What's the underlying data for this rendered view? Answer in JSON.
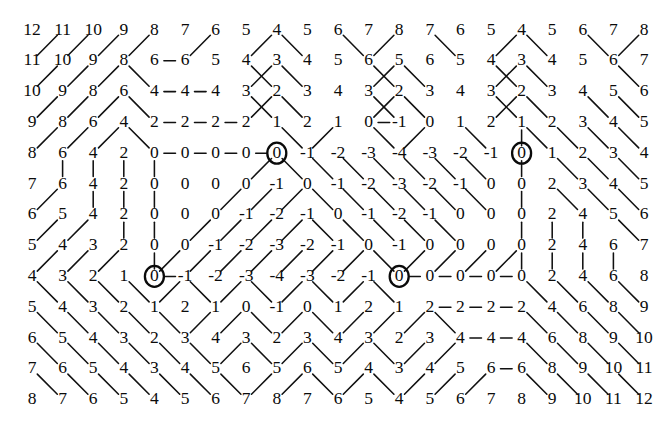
{
  "figure": {
    "rows": 13,
    "cols": 21,
    "origin_x": 32,
    "origin_y": 30,
    "step_x": 30.6,
    "step_y": 30.8,
    "ink_color": "#0b0b0b",
    "background_color": "#ffffff",
    "line_color": "#111111",
    "marker_label": "circled-minimum"
  },
  "chart_data": {
    "type": "heatmap",
    "xlabel": "",
    "ylabel": "",
    "categories": [
      "c1",
      "c2",
      "c3",
      "c4",
      "c5",
      "c6",
      "c7",
      "c8",
      "c9",
      "c10",
      "c11",
      "c12",
      "c13",
      "c14",
      "c15",
      "c16",
      "c17",
      "c18",
      "c19",
      "c20",
      "c21"
    ],
    "grid": [
      [
        12,
        11,
        10,
        9,
        8,
        7,
        6,
        5,
        4,
        5,
        6,
        7,
        8,
        7,
        6,
        5,
        4,
        5,
        6,
        7,
        8
      ],
      [
        11,
        10,
        9,
        8,
        6,
        6,
        5,
        4,
        3,
        4,
        5,
        6,
        5,
        6,
        5,
        4,
        3,
        4,
        5,
        6,
        7
      ],
      [
        10,
        9,
        8,
        6,
        4,
        4,
        4,
        3,
        2,
        3,
        4,
        3,
        2,
        3,
        4,
        3,
        2,
        3,
        4,
        5,
        6
      ],
      [
        9,
        8,
        6,
        4,
        2,
        2,
        2,
        2,
        1,
        2,
        1,
        0,
        -1,
        0,
        1,
        2,
        1,
        2,
        3,
        4,
        5
      ],
      [
        8,
        6,
        4,
        2,
        0,
        0,
        0,
        0,
        0,
        -1,
        -2,
        -3,
        -4,
        -3,
        -2,
        -1,
        0,
        1,
        2,
        3,
        4
      ],
      [
        7,
        6,
        4,
        2,
        0,
        0,
        0,
        0,
        -1,
        0,
        -1,
        -2,
        -3,
        -2,
        -1,
        0,
        0,
        2,
        3,
        4,
        5
      ],
      [
        6,
        5,
        4,
        2,
        0,
        0,
        0,
        -1,
        -2,
        -1,
        0,
        -1,
        -2,
        -1,
        0,
        0,
        0,
        2,
        4,
        5,
        6
      ],
      [
        5,
        4,
        3,
        2,
        0,
        0,
        -1,
        -2,
        -3,
        -2,
        -1,
        0,
        -1,
        0,
        0,
        0,
        0,
        2,
        4,
        6,
        7
      ],
      [
        4,
        3,
        2,
        1,
        0,
        -1,
        -2,
        -3,
        -4,
        -3,
        -2,
        -1,
        0,
        0,
        0,
        0,
        0,
        2,
        4,
        6,
        8
      ],
      [
        5,
        4,
        3,
        2,
        1,
        2,
        1,
        0,
        -1,
        0,
        1,
        2,
        1,
        2,
        2,
        2,
        2,
        4,
        6,
        8,
        9
      ],
      [
        6,
        5,
        4,
        3,
        2,
        3,
        4,
        3,
        2,
        3,
        4,
        3,
        2,
        3,
        4,
        4,
        4,
        6,
        8,
        9,
        10
      ],
      [
        7,
        6,
        5,
        4,
        3,
        4,
        5,
        6,
        5,
        6,
        5,
        4,
        3,
        4,
        5,
        6,
        6,
        8,
        9,
        10,
        11
      ],
      [
        8,
        7,
        6,
        5,
        4,
        5,
        6,
        7,
        8,
        7,
        6,
        5,
        4,
        5,
        6,
        7,
        8,
        9,
        10,
        11,
        12
      ]
    ],
    "circled_cells": [
      {
        "row": 4,
        "col": 8,
        "value": 0
      },
      {
        "row": 4,
        "col": 16,
        "value": 0
      },
      {
        "row": 8,
        "col": 4,
        "value": 0
      },
      {
        "row": 8,
        "col": 12,
        "value": 0
      }
    ],
    "edges": [
      [
        0,
        1,
        1,
        0
      ],
      [
        0,
        2,
        1,
        1
      ],
      [
        0,
        3,
        1,
        2
      ],
      [
        0,
        4,
        1,
        3
      ],
      [
        0,
        6,
        1,
        5
      ],
      [
        0,
        8,
        1,
        7
      ],
      [
        0,
        8,
        1,
        9
      ],
      [
        0,
        10,
        1,
        11
      ],
      [
        0,
        12,
        1,
        11
      ],
      [
        0,
        13,
        1,
        14
      ],
      [
        0,
        16,
        1,
        15
      ],
      [
        0,
        16,
        1,
        17
      ],
      [
        0,
        18,
        1,
        19
      ],
      [
        0,
        20,
        1,
        19
      ],
      [
        1,
        1,
        2,
        0
      ],
      [
        1,
        2,
        2,
        1
      ],
      [
        1,
        3,
        2,
        2
      ],
      [
        1,
        3,
        2,
        4
      ],
      [
        1,
        4,
        1,
        5
      ],
      [
        1,
        7,
        2,
        8
      ],
      [
        1,
        8,
        2,
        7
      ],
      [
        1,
        8,
        2,
        9
      ],
      [
        1,
        11,
        2,
        12
      ],
      [
        1,
        12,
        2,
        11
      ],
      [
        1,
        12,
        2,
        13
      ],
      [
        1,
        15,
        2,
        16
      ],
      [
        1,
        16,
        2,
        15
      ],
      [
        1,
        16,
        2,
        17
      ],
      [
        1,
        19,
        2,
        20
      ],
      [
        2,
        1,
        3,
        0
      ],
      [
        2,
        2,
        3,
        1
      ],
      [
        2,
        3,
        3,
        2
      ],
      [
        2,
        3,
        3,
        4
      ],
      [
        2,
        4,
        2,
        5
      ],
      [
        2,
        5,
        2,
        6
      ],
      [
        2,
        7,
        3,
        8
      ],
      [
        2,
        8,
        3,
        7
      ],
      [
        2,
        8,
        3,
        9
      ],
      [
        2,
        11,
        3,
        12
      ],
      [
        2,
        12,
        3,
        11
      ],
      [
        2,
        12,
        3,
        13
      ],
      [
        2,
        15,
        3,
        16
      ],
      [
        2,
        16,
        3,
        15
      ],
      [
        2,
        16,
        3,
        17
      ],
      [
        2,
        18,
        3,
        19
      ],
      [
        2,
        19,
        3,
        20
      ],
      [
        3,
        1,
        4,
        0
      ],
      [
        3,
        2,
        4,
        1
      ],
      [
        3,
        3,
        4,
        2
      ],
      [
        3,
        3,
        4,
        4
      ],
      [
        3,
        4,
        3,
        5
      ],
      [
        3,
        5,
        3,
        6
      ],
      [
        3,
        6,
        3,
        7
      ],
      [
        3,
        8,
        4,
        9
      ],
      [
        3,
        10,
        4,
        9
      ],
      [
        3,
        11,
        4,
        12
      ],
      [
        3,
        12,
        3,
        11
      ],
      [
        3,
        13,
        4,
        12
      ],
      [
        3,
        14,
        4,
        15
      ],
      [
        3,
        16,
        4,
        16
      ],
      [
        3,
        16,
        4,
        17
      ],
      [
        3,
        17,
        4,
        18
      ],
      [
        3,
        18,
        4,
        19
      ],
      [
        3,
        19,
        4,
        20
      ],
      [
        4,
        1,
        5,
        1
      ],
      [
        4,
        2,
        5,
        2
      ],
      [
        4,
        3,
        5,
        3
      ],
      [
        4,
        4,
        4,
        5
      ],
      [
        4,
        5,
        4,
        6
      ],
      [
        4,
        6,
        4,
        7
      ],
      [
        4,
        7,
        4,
        8
      ],
      [
        4,
        4,
        5,
        4
      ],
      [
        4,
        8,
        5,
        7
      ],
      [
        4,
        8,
        5,
        9
      ],
      [
        4,
        9,
        5,
        10
      ],
      [
        4,
        10,
        5,
        11
      ],
      [
        4,
        11,
        5,
        12
      ],
      [
        4,
        12,
        5,
        13
      ],
      [
        4,
        13,
        5,
        14
      ],
      [
        4,
        14,
        5,
        15
      ],
      [
        4,
        16,
        5,
        16
      ],
      [
        4,
        17,
        5,
        18
      ],
      [
        4,
        18,
        5,
        19
      ],
      [
        4,
        19,
        5,
        20
      ],
      [
        5,
        1,
        6,
        0
      ],
      [
        5,
        2,
        6,
        2
      ],
      [
        5,
        3,
        6,
        3
      ],
      [
        5,
        4,
        6,
        4
      ],
      [
        5,
        7,
        6,
        6
      ],
      [
        5,
        8,
        6,
        7
      ],
      [
        5,
        9,
        6,
        8
      ],
      [
        5,
        9,
        6,
        10
      ],
      [
        5,
        10,
        6,
        11
      ],
      [
        5,
        11,
        6,
        12
      ],
      [
        5,
        12,
        6,
        13
      ],
      [
        5,
        13,
        6,
        14
      ],
      [
        5,
        14,
        6,
        15
      ],
      [
        5,
        16,
        6,
        16
      ],
      [
        5,
        17,
        6,
        18
      ],
      [
        5,
        18,
        6,
        19
      ],
      [
        5,
        19,
        6,
        20
      ],
      [
        6,
        1,
        7,
        0
      ],
      [
        6,
        2,
        7,
        1
      ],
      [
        6,
        3,
        7,
        3
      ],
      [
        6,
        4,
        7,
        4
      ],
      [
        6,
        6,
        7,
        5
      ],
      [
        6,
        7,
        7,
        6
      ],
      [
        6,
        8,
        7,
        7
      ],
      [
        6,
        9,
        7,
        8
      ],
      [
        6,
        9,
        7,
        10
      ],
      [
        6,
        10,
        7,
        11
      ],
      [
        6,
        11,
        7,
        12
      ],
      [
        6,
        12,
        7,
        13
      ],
      [
        6,
        13,
        7,
        14
      ],
      [
        6,
        16,
        7,
        16
      ],
      [
        6,
        17,
        7,
        17
      ],
      [
        6,
        18,
        7,
        18
      ],
      [
        6,
        19,
        7,
        20
      ],
      [
        7,
        1,
        8,
        0
      ],
      [
        7,
        2,
        8,
        1
      ],
      [
        7,
        3,
        8,
        2
      ],
      [
        7,
        4,
        8,
        4
      ],
      [
        7,
        5,
        8,
        4
      ],
      [
        7,
        6,
        8,
        5
      ],
      [
        7,
        7,
        8,
        6
      ],
      [
        7,
        8,
        8,
        7
      ],
      [
        7,
        9,
        8,
        8
      ],
      [
        7,
        10,
        8,
        9
      ],
      [
        7,
        11,
        8,
        10
      ],
      [
        7,
        11,
        8,
        12
      ],
      [
        7,
        13,
        8,
        12
      ],
      [
        7,
        14,
        8,
        13
      ],
      [
        7,
        15,
        8,
        14
      ],
      [
        7,
        16,
        8,
        15
      ],
      [
        7,
        16,
        8,
        16
      ],
      [
        7,
        17,
        8,
        17
      ],
      [
        7,
        18,
        8,
        18
      ],
      [
        7,
        19,
        8,
        19
      ],
      [
        8,
        4,
        8,
        5
      ],
      [
        8,
        12,
        8,
        13
      ],
      [
        8,
        13,
        8,
        14
      ],
      [
        8,
        14,
        8,
        15
      ],
      [
        8,
        15,
        8,
        16
      ],
      [
        8,
        0,
        9,
        1
      ],
      [
        8,
        1,
        9,
        2
      ],
      [
        8,
        2,
        9,
        3
      ],
      [
        8,
        3,
        9,
        4
      ],
      [
        8,
        5,
        9,
        4
      ],
      [
        8,
        5,
        9,
        6
      ],
      [
        8,
        7,
        9,
        6
      ],
      [
        8,
        7,
        9,
        8
      ],
      [
        8,
        9,
        9,
        8
      ],
      [
        8,
        9,
        9,
        10
      ],
      [
        8,
        11,
        9,
        10
      ],
      [
        8,
        11,
        9,
        12
      ],
      [
        8,
        16,
        9,
        17
      ],
      [
        8,
        17,
        9,
        18
      ],
      [
        8,
        18,
        9,
        19
      ],
      [
        8,
        19,
        9,
        20
      ],
      [
        9,
        0,
        10,
        1
      ],
      [
        9,
        1,
        10,
        2
      ],
      [
        9,
        2,
        10,
        3
      ],
      [
        9,
        3,
        10,
        4
      ],
      [
        9,
        4,
        10,
        5
      ],
      [
        9,
        6,
        10,
        5
      ],
      [
        9,
        7,
        10,
        6
      ],
      [
        9,
        7,
        10,
        8
      ],
      [
        9,
        9,
        10,
        8
      ],
      [
        9,
        9,
        10,
        10
      ],
      [
        9,
        11,
        10,
        10
      ],
      [
        9,
        12,
        10,
        11
      ],
      [
        9,
        13,
        10,
        12
      ],
      [
        9,
        13,
        10,
        14
      ],
      [
        9,
        13,
        9,
        14
      ],
      [
        9,
        14,
        9,
        15
      ],
      [
        9,
        15,
        9,
        16
      ],
      [
        9,
        16,
        10,
        17
      ],
      [
        9,
        17,
        10,
        18
      ],
      [
        9,
        18,
        10,
        19
      ],
      [
        9,
        19,
        10,
        20
      ],
      [
        10,
        0,
        11,
        1
      ],
      [
        10,
        1,
        11,
        2
      ],
      [
        10,
        2,
        11,
        3
      ],
      [
        10,
        3,
        11,
        4
      ],
      [
        10,
        4,
        11,
        5
      ],
      [
        10,
        5,
        11,
        6
      ],
      [
        10,
        7,
        11,
        6
      ],
      [
        10,
        7,
        11,
        8
      ],
      [
        10,
        9,
        11,
        8
      ],
      [
        10,
        9,
        11,
        10
      ],
      [
        10,
        11,
        11,
        10
      ],
      [
        10,
        11,
        11,
        12
      ],
      [
        10,
        13,
        11,
        12
      ],
      [
        10,
        14,
        11,
        13
      ],
      [
        10,
        14,
        10,
        15
      ],
      [
        10,
        15,
        10,
        16
      ],
      [
        10,
        16,
        11,
        17
      ],
      [
        10,
        17,
        11,
        18
      ],
      [
        10,
        18,
        11,
        19
      ],
      [
        10,
        19,
        11,
        20
      ],
      [
        11,
        0,
        12,
        1
      ],
      [
        11,
        1,
        12,
        2
      ],
      [
        11,
        2,
        12,
        3
      ],
      [
        11,
        3,
        12,
        4
      ],
      [
        11,
        4,
        12,
        5
      ],
      [
        11,
        5,
        12,
        6
      ],
      [
        11,
        6,
        12,
        7
      ],
      [
        11,
        8,
        12,
        7
      ],
      [
        11,
        9,
        12,
        8
      ],
      [
        11,
        9,
        12,
        10
      ],
      [
        11,
        11,
        12,
        10
      ],
      [
        11,
        11,
        12,
        12
      ],
      [
        11,
        13,
        12,
        12
      ],
      [
        11,
        14,
        12,
        13
      ],
      [
        11,
        15,
        12,
        14
      ],
      [
        11,
        15,
        11,
        16
      ],
      [
        11,
        16,
        12,
        17
      ],
      [
        11,
        17,
        12,
        18
      ],
      [
        11,
        18,
        12,
        19
      ],
      [
        11,
        19,
        12,
        20
      ]
    ]
  }
}
